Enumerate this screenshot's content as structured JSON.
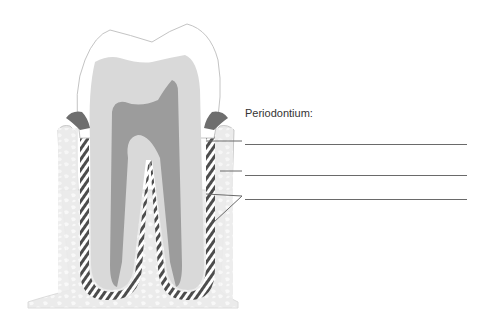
{
  "diagram": {
    "title": "Periodontium:",
    "answer_lines": [
      {
        "id": 1,
        "value": ""
      },
      {
        "id": 2,
        "value": ""
      },
      {
        "id": 3,
        "value": ""
      }
    ],
    "colors": {
      "enamel": "#ffffff",
      "dentin": "#d9d9d9",
      "pulp": "#9c9c9c",
      "bone": "#ebebeb",
      "bone_pattern": "#f7f7f7",
      "ligament_dark": "#555555",
      "gingiva": "#6e6e6e",
      "outline": "#bdbdbd",
      "leader": "#6a6a6a"
    }
  }
}
